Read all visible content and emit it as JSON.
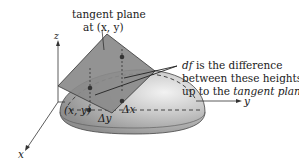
{
  "labels": {
    "tangent_plane_line1": "tangent plane",
    "tangent_plane_line2": "at (x, y)",
    "df_prefix": "df",
    "df_line1_rest": " is the difference",
    "df_line2": "between these heights",
    "df_line3_prefix": "up to the ",
    "df_line3_em": "tangent plane",
    "axis_x": "x",
    "axis_y": "y",
    "axis_z": "z",
    "point_xy": "(x, y)",
    "delta_x": "Δx",
    "delta_y": "Δy"
  },
  "colors": {
    "plane_fill": "#8c8c8c",
    "surface_fill": "#b8b8b8",
    "surface_highlight": "#ececec",
    "line": "#333333",
    "background": "#ffffff"
  }
}
